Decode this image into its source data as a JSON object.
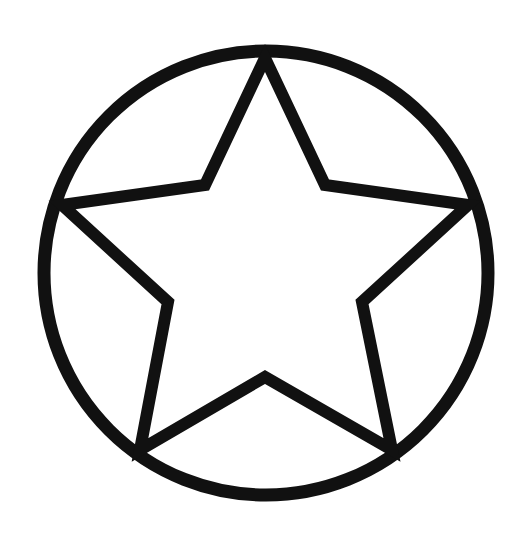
{
  "figure": {
    "stroke_color": "#111111",
    "fill_color": "#ffffff",
    "circle": {
      "cx": 266,
      "cy": 273,
      "r": 222,
      "stroke_width": 13
    },
    "star": {
      "stroke_width": 12,
      "points": "265,58 325,185 468,205 362,302 392,450 265,377 140,450 168,302 62,205 205,185"
    }
  }
}
